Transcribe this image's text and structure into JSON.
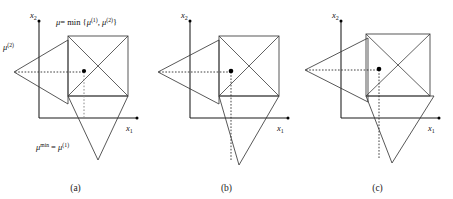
{
  "figure": {
    "kind": "geometry-diagram",
    "background": "#ffffff",
    "stroke_color": "#3a3a3a",
    "axis_color": "#1a1a1a",
    "point_color": "#000000",
    "panel_count": 3
  },
  "axes": {
    "x_label_base": "x",
    "x_label_sub": "1",
    "y_label_base": "x",
    "y_label_sub": "2"
  },
  "panels": [
    {
      "id": "a",
      "caption": "(a)",
      "has_annotations": true
    },
    {
      "id": "b",
      "caption": "(b)",
      "has_annotations": false
    },
    {
      "id": "c",
      "caption": "(c)",
      "has_annotations": false
    }
  ],
  "annotations": {
    "top": {
      "mu": "μ",
      "equals_min": "= min {",
      "mu1": "μ",
      "sup1": "(1)",
      "comma": ", ",
      "mu2": "μ",
      "sup2": "(2)",
      "close": "}"
    },
    "left": {
      "mu": "μ",
      "sup": "(2)"
    },
    "bottom": {
      "mu_min": "μ",
      "sup_min": "min",
      "equals": " = ",
      "mu1": "μ",
      "sup1": "(1)"
    }
  }
}
